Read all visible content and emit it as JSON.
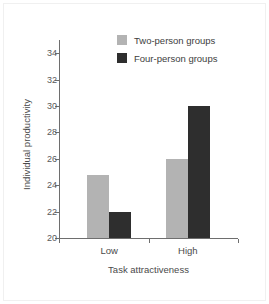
{
  "chart_data": {
    "type": "bar",
    "title": "",
    "xlabel": "Task attractiveness",
    "ylabel": "Individual productivity",
    "categories": [
      "Low",
      "High"
    ],
    "series": [
      {
        "name": "Two-person groups",
        "values": [
          24.8,
          26.0
        ],
        "color": "#b3b3b3"
      },
      {
        "name": "Four-person groups",
        "values": [
          22.0,
          30.0
        ],
        "color": "#2e2e2e"
      }
    ],
    "ylim": [
      20,
      35
    ],
    "yticks": [
      20,
      22,
      24,
      26,
      28,
      30,
      32,
      34
    ],
    "ytick_labels": [
      "20",
      "22",
      "24",
      "26",
      "28",
      "30",
      "32",
      "34"
    ],
    "grid": false,
    "legend_position": "top-right",
    "axis_color": "#6e6e6e",
    "background": "#ffffff"
  }
}
